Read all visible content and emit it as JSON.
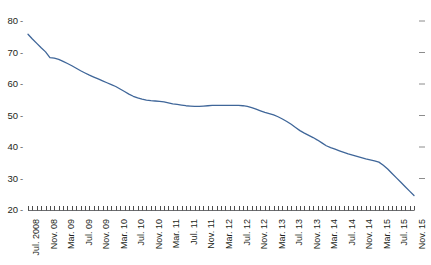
{
  "chart_data": {
    "type": "line",
    "title": "",
    "subtitle": "",
    "xlabel": "",
    "ylabel": "",
    "ylim": [
      20,
      80
    ],
    "yticks": [
      20,
      30,
      40,
      50,
      60,
      70,
      80
    ],
    "ytick_labels": [
      "20",
      "30",
      "40",
      "50",
      "60",
      "70",
      "80"
    ],
    "grid": false,
    "legend": null,
    "legend_position": "none",
    "right_axis_ticks": true,
    "line_color": "#3f6699",
    "x_tick_interval_months": 1,
    "x_label_interval_months": 4,
    "xtick_labels": [
      "Jul. 2008",
      "Nov. 08",
      "Mar. 09",
      "Jul. 09",
      "Nov. 09",
      "Mar. 10",
      "Jul. 10",
      "Nov. 10",
      "Mar. 11",
      "Jul. 11",
      "Nov. 11",
      "Mar. 12",
      "Jul. 12",
      "Nov. 12",
      "Mar. 13",
      "Jul. 13",
      "Nov. 13",
      "Mar. 14",
      "Jul. 14",
      "Nov. 14",
      "Mar. 15",
      "Jul. 15",
      "Nov. 15"
    ],
    "x": [
      "Jul. 2008",
      "Aug. 2008",
      "Sep. 2008",
      "Oct. 2008",
      "Nov. 2008",
      "Dec. 2008",
      "Jan. 2009",
      "Feb. 2009",
      "Mar. 2009",
      "Apr. 2009",
      "May 2009",
      "Jun. 2009",
      "Jul. 2009",
      "Aug. 2009",
      "Sep. 2009",
      "Oct. 2009",
      "Nov. 2009",
      "Dec. 2009",
      "Jan. 2010",
      "Feb. 2010",
      "Mar. 2010",
      "Apr. 2010",
      "May 2010",
      "Jun. 2010",
      "Jul. 2010",
      "Aug. 2010",
      "Sep. 2010",
      "Oct. 2010",
      "Nov. 2010",
      "Dec. 2010",
      "Jan. 2011",
      "Feb. 2011",
      "Mar. 2011",
      "Apr. 2011",
      "May 2011",
      "Jun. 2011",
      "Jul. 2011",
      "Aug. 2011",
      "Sep. 2011",
      "Oct. 2011",
      "Nov. 2011",
      "Dec. 2011",
      "Jan. 2012",
      "Feb. 2012",
      "Mar. 2012",
      "Apr. 2012",
      "May 2012",
      "Jun. 2012",
      "Jul. 2012",
      "Aug. 2012",
      "Sep. 2012",
      "Oct. 2012",
      "Nov. 2012",
      "Dec. 2012",
      "Jan. 2013",
      "Feb. 2013",
      "Mar. 2013",
      "Apr. 2013",
      "May 2013",
      "Jun. 2013",
      "Jul. 2013",
      "Aug. 2013",
      "Sep. 2013",
      "Oct. 2013",
      "Nov. 2013",
      "Dec. 2013",
      "Jan. 2014",
      "Feb. 2014",
      "Mar. 2014",
      "Apr. 2014",
      "May 2014",
      "Jun. 2014",
      "Jul. 2014",
      "Aug. 2014",
      "Sep. 2014",
      "Oct. 2014",
      "Nov. 2014",
      "Dec. 2014",
      "Jan. 2015",
      "Feb. 2015",
      "Mar. 2015",
      "Apr. 2015",
      "May 2015",
      "Jun. 2015",
      "Jul. 2015",
      "Aug. 2015",
      "Sep. 2015",
      "Oct. 2015",
      "Nov. 2015"
    ],
    "values": [
      75.8,
      74.3,
      72.9,
      71.5,
      70.2,
      68.4,
      68.2,
      67.8,
      67.2,
      66.5,
      65.8,
      65.0,
      64.2,
      63.5,
      62.8,
      62.2,
      61.6,
      61.0,
      60.4,
      59.8,
      59.2,
      58.4,
      57.6,
      56.8,
      56.1,
      55.6,
      55.2,
      54.9,
      54.7,
      54.6,
      54.5,
      54.3,
      54.0,
      53.7,
      53.5,
      53.3,
      53.1,
      53.0,
      52.9,
      52.9,
      53.0,
      53.1,
      53.2,
      53.2,
      53.2,
      53.2,
      53.2,
      53.2,
      53.2,
      53.1,
      52.9,
      52.5,
      52.0,
      51.5,
      51.0,
      50.6,
      50.2,
      49.6,
      48.9,
      48.1,
      47.2,
      46.2,
      45.2,
      44.4,
      43.7,
      43.0,
      42.2,
      41.3,
      40.4,
      39.8,
      39.3,
      38.8,
      38.3,
      37.8,
      37.4,
      37.0,
      36.6,
      36.2,
      35.9,
      35.6,
      35.2,
      34.2,
      33.0,
      31.6,
      30.2,
      28.8,
      27.4,
      26.0,
      24.6
    ]
  }
}
